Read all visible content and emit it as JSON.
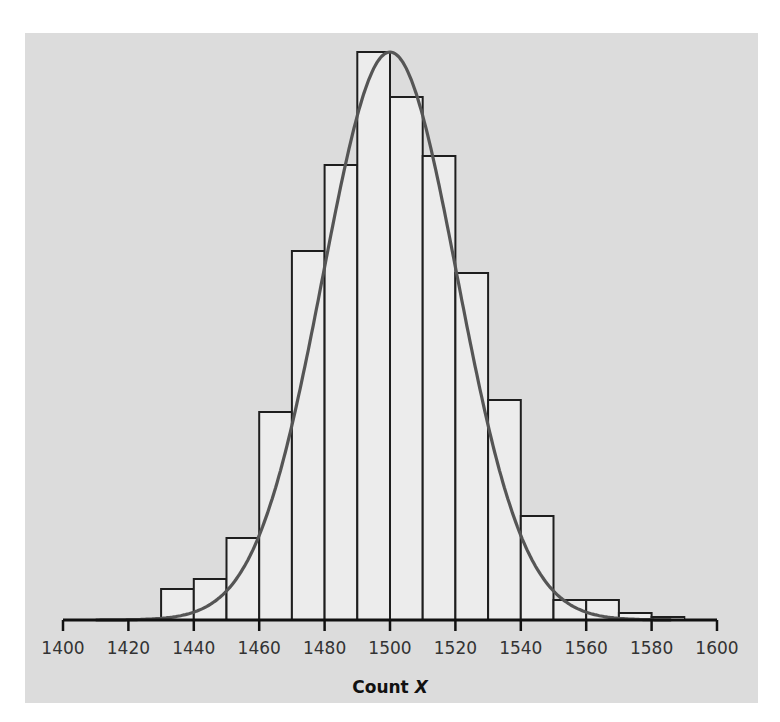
{
  "chart_data": {
    "type": "bar",
    "subtype": "histogram_with_normal_curve",
    "title": "",
    "xlabel": "Count X",
    "xlabel_parts": {
      "text": "Count ",
      "var": "X"
    },
    "ylabel": "",
    "xlim": [
      1400,
      1600
    ],
    "x_ticks": [
      1400,
      1420,
      1440,
      1460,
      1480,
      1500,
      1520,
      1540,
      1560,
      1580,
      1600
    ],
    "y_axis_shown": false,
    "grid": false,
    "legend": null,
    "bin_width": 10,
    "bins": [
      {
        "start": 1430,
        "end": 1440,
        "height": 31
      },
      {
        "start": 1440,
        "end": 1450,
        "height": 41
      },
      {
        "start": 1450,
        "end": 1460,
        "height": 82
      },
      {
        "start": 1460,
        "end": 1470,
        "height": 208
      },
      {
        "start": 1470,
        "end": 1480,
        "height": 369
      },
      {
        "start": 1480,
        "end": 1490,
        "height": 455
      },
      {
        "start": 1490,
        "end": 1500,
        "height": 568
      },
      {
        "start": 1500,
        "end": 1510,
        "height": 523
      },
      {
        "start": 1510,
        "end": 1520,
        "height": 464
      },
      {
        "start": 1520,
        "end": 1530,
        "height": 347
      },
      {
        "start": 1530,
        "end": 1540,
        "height": 220
      },
      {
        "start": 1540,
        "end": 1550,
        "height": 104
      },
      {
        "start": 1550,
        "end": 1560,
        "height": 20
      },
      {
        "start": 1560,
        "end": 1570,
        "height": 20
      },
      {
        "start": 1570,
        "end": 1580,
        "height": 7
      },
      {
        "start": 1580,
        "end": 1590,
        "height": 3
      }
    ],
    "height_units": "relative (no y-axis shown)",
    "normal_curve": {
      "mean": 1500,
      "sd": 20.5,
      "peak_height": 568,
      "x_range": [
        1410,
        1586
      ]
    }
  },
  "colors": {
    "panel_bg": "#dcdcdc",
    "bar_fill": "#ececec",
    "bar_stroke": "#1e1e1e",
    "curve": "#555555",
    "axis": "#111111"
  }
}
